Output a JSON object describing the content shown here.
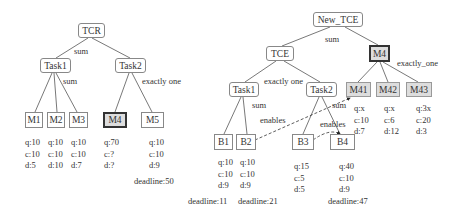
{
  "left_tree": {
    "root": "TCR",
    "root_op": "sum",
    "task1": "Task1",
    "task1_op": "sum",
    "task2": "Task2",
    "task2_op": "exactly one",
    "leaves": [
      {
        "label": "M1",
        "q": "q:10",
        "c": "c:10",
        "d": "d:5"
      },
      {
        "label": "M2",
        "q": "q:10",
        "c": "c:10",
        "d": "d:10"
      },
      {
        "label": "M3",
        "q": "q:10",
        "c": "c:10",
        "d": "d:7"
      },
      {
        "label": "M4",
        "q": "q:70",
        "c": "c:?",
        "d": "d:?"
      },
      {
        "label": "M5",
        "q": "q:10",
        "c": "c:10",
        "d": "d:9",
        "deadline": "deadline:50"
      }
    ]
  },
  "right_tree": {
    "root": "New_TCE",
    "root_op": "sum",
    "tce": "TCE",
    "tce_op": "exactly one",
    "m4": "M4",
    "m4_op": "exactly_one",
    "task1": "Task1",
    "task1_op": "sum",
    "task2": "Task2",
    "task2_op": "sum",
    "enables_1": "enables",
    "enables_2": "enables",
    "m4_children": [
      {
        "label": "M41",
        "q": "q:x",
        "c": "c:10",
        "d": "d:7"
      },
      {
        "label": "M42",
        "q": "q:x",
        "c": "c:6",
        "d": "d:12"
      },
      {
        "label": "M43",
        "q": "q:3x",
        "c": "c:20",
        "d": "d:3"
      }
    ],
    "leaves": [
      {
        "label": "B1",
        "q": "q:10",
        "c": "c:10",
        "d": "d:9",
        "deadline": "deadline:11"
      },
      {
        "label": "B2",
        "q": "q:10",
        "c": "c:10",
        "d": "d:9",
        "deadline": "deadline:21"
      },
      {
        "label": "B3",
        "q": "q:15",
        "c": "c:5",
        "d": "d:5"
      },
      {
        "label": "B4",
        "q": "q:40",
        "c": "c:10",
        "d": "d:9",
        "deadline": "deadline:47"
      }
    ]
  }
}
